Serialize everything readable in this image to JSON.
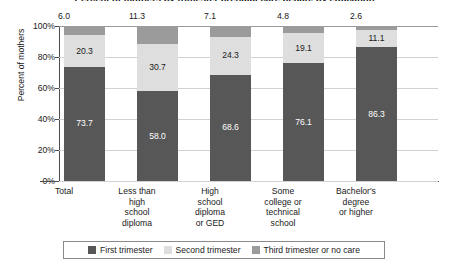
{
  "chart_data": {
    "type": "bar",
    "subtype": "stacked-bar-percent",
    "title": "Percent of mothers by trimester prenatal care began, by education",
    "xlabel": "",
    "ylabel": "Percent of mothers",
    "ylim": [
      0,
      100
    ],
    "ytick_labels": [
      "0%",
      "20%",
      "40%",
      "60%",
      "80%",
      "100%"
    ],
    "ytick_values": [
      0,
      20,
      40,
      60,
      80,
      100
    ],
    "grid": true,
    "legend_position": "bottom",
    "categories": [
      "Total",
      "Less than high school diploma",
      "High school diploma or GED",
      "Some college or technical school",
      "Bachelor's degree or higher"
    ],
    "category_lines": [
      [
        "Total"
      ],
      [
        "Less than",
        "high",
        "school",
        "diploma"
      ],
      [
        "High",
        "school",
        "diploma",
        "or GED"
      ],
      [
        "Some",
        "college or",
        "technical",
        "school"
      ],
      [
        "Bachelor's",
        "degree",
        "or higher"
      ]
    ],
    "series": [
      {
        "name": "First trimester",
        "color": "#575757",
        "values": [
          73.7,
          58.0,
          68.6,
          76.1,
          86.3
        ],
        "labels": [
          "73.7",
          "58.0",
          "68.6",
          "76.1",
          "86.3"
        ]
      },
      {
        "name": "Second trimester",
        "color": "#dedede",
        "values": [
          20.3,
          30.7,
          24.3,
          19.1,
          11.1
        ],
        "labels": [
          "20.3",
          "30.7",
          "24.3",
          "19.1",
          "11.1"
        ]
      },
      {
        "name": "Third trimester or no care",
        "color": "#9b9b9b",
        "values": [
          6.0,
          11.3,
          7.1,
          4.8,
          2.6
        ],
        "labels": [
          "6.0",
          "11.3",
          "7.1",
          "4.8",
          "2.6"
        ],
        "labels_above_bar": true
      }
    ],
    "top_values": [
      "6.0",
      "11.3",
      "7.1",
      "4.8",
      "2.6"
    ]
  },
  "legend": {
    "items": [
      {
        "label": "First trimester",
        "swatch": "s1"
      },
      {
        "label": "Second trimester",
        "swatch": "s2"
      },
      {
        "label": "Third trimester or no care",
        "swatch": "s3"
      }
    ]
  }
}
